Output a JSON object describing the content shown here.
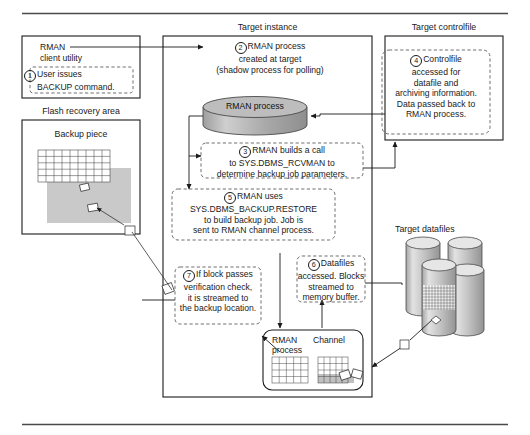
{
  "figure": {
    "type": "process-flow-diagram"
  },
  "groups": {
    "client": {
      "label": ""
    },
    "target_instance": {
      "label": "Target instance"
    },
    "target_controlfile": {
      "label": "Target controlfile"
    },
    "flash_recovery_area": {
      "label": "Flash recovery area"
    },
    "backup_piece": {
      "label": "Backup piece"
    },
    "target_datafiles": {
      "label": "Target datafiles"
    }
  },
  "nodes": {
    "rman_client": {
      "line1": "RMAN",
      "line2": "client utility"
    },
    "rman_process_cylinder": {
      "label": "RMAN process"
    },
    "channel_box": {
      "left_line1": "RMAN",
      "left_line2": "process",
      "right_label": "Channel"
    }
  },
  "steps": [
    {
      "number": "1",
      "lines": [
        "User issues",
        "BACKUP command."
      ]
    },
    {
      "number": "2",
      "lines": [
        "RMAN process",
        "created at target",
        "(shadow process for polling)"
      ]
    },
    {
      "number": "3",
      "lines": [
        "RMAN builds a call",
        "to SYS.DBMS_RCVMAN to",
        "determine backup job parameters."
      ]
    },
    {
      "number": "4",
      "lines": [
        "Controlfile",
        "accessed for",
        "datafile and",
        "archiving information.",
        "Data passed back to",
        "RMAN process."
      ]
    },
    {
      "number": "5",
      "lines": [
        "RMAN uses",
        "SYS.DBMS_BACKUP.RESTORE",
        "to build backup job. Job is",
        "sent to RMAN channel process."
      ]
    },
    {
      "number": "6",
      "lines": [
        "Datafiles",
        "accessed. Blocks",
        "streamed to",
        "memory buffer."
      ]
    },
    {
      "number": "7",
      "lines": [
        "If block passes",
        "verification check,",
        "it is streamed to",
        "the backup location."
      ]
    }
  ],
  "colors": {
    "line": "#1a1a1a",
    "dashed": "#555555",
    "cylinder_fill": "#b5b5b5",
    "cylinder_top": "#d8d8d8",
    "gray_fill": "#c9c9c9",
    "rule": "#4a4a4a"
  }
}
